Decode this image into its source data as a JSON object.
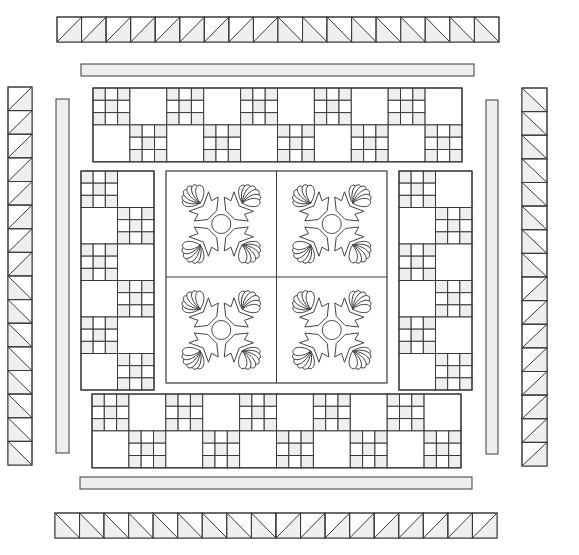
{
  "diagram": {
    "title": "",
    "type": "quilt-layout",
    "colors": {
      "background": "#ffffff",
      "line": "#3a3a3a",
      "shade": "#efefef",
      "fill": "#ffffff"
    },
    "outer_border": {
      "top": {
        "x": 57,
        "y": 17,
        "w": 442,
        "h": 25,
        "count": 18,
        "first_half_diagonal": "/",
        "second_half_diagonal": "\\"
      },
      "bottom": {
        "x": 55,
        "y": 513,
        "w": 442,
        "h": 25,
        "count": 18,
        "first_half_diagonal": "\\",
        "second_half_diagonal": "/"
      },
      "left": {
        "x": 8,
        "y": 87,
        "w": 24,
        "h": 378,
        "count": 16,
        "first_half_diagonal": "/",
        "second_half_diagonal": "\\"
      },
      "right": {
        "x": 522,
        "y": 88,
        "w": 25,
        "h": 378,
        "count": 16,
        "first_half_diagonal": "\\",
        "second_half_diagonal": "/"
      }
    },
    "sashing": {
      "top": {
        "x": 81,
        "y": 64,
        "w": 393,
        "h": 12
      },
      "bottom": {
        "x": 80,
        "y": 477,
        "w": 392,
        "h": 12
      },
      "left": {
        "x": 56,
        "y": 99,
        "w": 13,
        "h": 354
      },
      "right": {
        "x": 486,
        "y": 100,
        "w": 12,
        "h": 354
      }
    },
    "block_rows": {
      "top": {
        "x": 93,
        "y": 88,
        "cols": 10,
        "rows": 2,
        "cell": 36.9,
        "pattern": "checker-ninepatch-first"
      },
      "bottom": {
        "x": 92,
        "y": 394,
        "cols": 10,
        "rows": 2,
        "cell": 36.9,
        "pattern": "checker-ninepatch-first"
      },
      "left": {
        "x": 81,
        "y": 171,
        "cols": 2,
        "rows": 6,
        "cell": 36.5,
        "pattern": "checker-ninepatch-first"
      },
      "right": {
        "x": 399,
        "y": 171,
        "cols": 2,
        "rows": 6,
        "cell": 36.5,
        "pattern": "checker-ninepatch-first"
      }
    },
    "center_medallion": {
      "x": 166,
      "y": 171,
      "w": 221,
      "h": 212,
      "grid": [
        2,
        2
      ],
      "motif": "feathered-applique-rosette",
      "motif_parts": {
        "center_circle": 1,
        "feather_sprays": 4,
        "leaves_per_spray": 6
      }
    },
    "nine_patch": {
      "grid": 3,
      "shaded_cells": [
        0,
        2,
        4,
        6,
        8
      ]
    }
  }
}
